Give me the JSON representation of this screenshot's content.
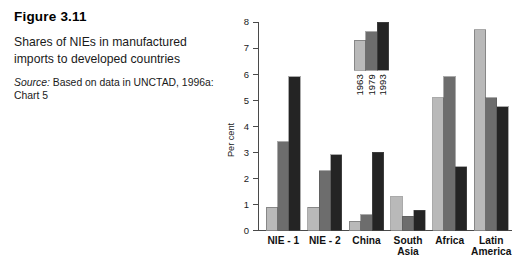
{
  "caption": {
    "figure_number": "Figure 3.11",
    "title": "Shares of NIEs in manufactured imports to developed countries",
    "source_label": "Source:",
    "source_text": " Based on data in UNCTAD, 1996a: Chart 5"
  },
  "colors": {
    "series_1963": "#b9b9b9",
    "series_1979": "#6d6d6d",
    "series_1993": "#242424",
    "axis": "#4a4a4a",
    "text": "#1a1a1a"
  },
  "chart_data": {
    "type": "bar",
    "title": "",
    "xlabel": "",
    "ylabel": "Per cent",
    "ylim": [
      0,
      8
    ],
    "yticks": [
      0,
      1,
      2,
      3,
      4,
      5,
      6,
      7,
      8
    ],
    "ytick_labels": [
      "0",
      "1",
      "2",
      "3",
      "4",
      "5",
      "6",
      "7",
      "8"
    ],
    "grid": false,
    "legend_position": "inside-top-center",
    "categories": [
      "NIE - 1",
      "NIE - 2",
      "China",
      "South Asia",
      "Africa",
      "Latin America"
    ],
    "category_lines": [
      [
        "NIE - 1"
      ],
      [
        "NIE - 2"
      ],
      [
        "China"
      ],
      [
        "South",
        "Asia"
      ],
      [
        "Africa"
      ],
      [
        "Latin",
        "America"
      ]
    ],
    "series": [
      {
        "name": "1963",
        "color": "#b9b9b9",
        "values": [
          0.9,
          0.9,
          0.35,
          1.3,
          5.1,
          7.7
        ]
      },
      {
        "name": "1979",
        "color": "#6d6d6d",
        "values": [
          3.4,
          2.3,
          0.6,
          0.55,
          5.9,
          5.1
        ]
      },
      {
        "name": "1993",
        "color": "#242424",
        "values": [
          5.9,
          2.9,
          3.0,
          0.78,
          2.45,
          4.75
        ]
      }
    ],
    "legend_entries": [
      "1963",
      "1979",
      "1993"
    ],
    "legend_sample_values": [
      7.3,
      7.62,
      8.0
    ]
  }
}
